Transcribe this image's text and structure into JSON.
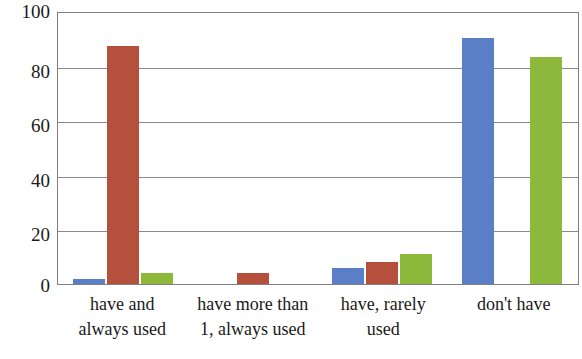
{
  "chart_data": {
    "type": "bar",
    "title": "",
    "subtitle": "",
    "xlabel": "",
    "ylabel": "",
    "ylim": [
      0,
      100
    ],
    "yticks": [
      0,
      20,
      40,
      60,
      80,
      100
    ],
    "grid": true,
    "legend": "none",
    "categories": [
      "have and always used",
      "have more than 1, always used",
      "have, rarely used",
      "don't have"
    ],
    "category_lines": [
      [
        "have and",
        "always used"
      ],
      [
        "have more than",
        "1, always used"
      ],
      [
        "have, rarely",
        "used"
      ],
      [
        "don't have",
        ""
      ]
    ],
    "series": [
      {
        "name": "series-1",
        "color": "#5b7fc7",
        "values": [
          2,
          0,
          6,
          91
        ]
      },
      {
        "name": "series-2",
        "color": "#b4503c",
        "values": [
          88,
          4,
          8,
          0
        ]
      },
      {
        "name": "series-3",
        "color": "#8cb93c",
        "values": [
          4,
          0,
          11,
          84
        ]
      }
    ],
    "colors": {
      "series_1": "#5b7fc7",
      "series_2": "#b4503c",
      "series_3": "#8cb93c",
      "gridline": "#8a8a8a",
      "axis_border": "#808080",
      "text": "#1a1a1a",
      "background": "#ffffff"
    }
  }
}
